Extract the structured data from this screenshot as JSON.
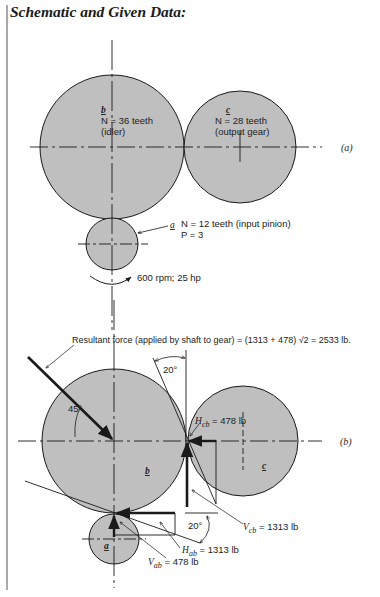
{
  "title": "Schematic and Given Data:",
  "colors": {
    "gear_fill": "#bfbfbf",
    "line": "#1a1a1a",
    "background": "#ffffff"
  },
  "diagram_a": {
    "panel_label": "(a)",
    "gear_b": {
      "letter": "b",
      "teeth": "N = 36 teeth",
      "role": "(idler)"
    },
    "gear_c": {
      "letter": "c",
      "teeth": "N = 28 teeth",
      "role": "(output gear)"
    },
    "gear_a": {
      "letter": "a",
      "teeth": "N = 12 teeth (input pinion)",
      "pitch": "P = 3"
    },
    "input": "600 rpm; 25 hp"
  },
  "diagram_b": {
    "panel_label": "(b)",
    "resultant": "Resultant force (applied by shaft to gear) = (1313 + 478)  √2 = 2533 lb.",
    "angle_45": "45°",
    "angle_20_top": "20°",
    "angle_20_bottom": "20°",
    "gear_b_letter": "b",
    "gear_c_letter": "c",
    "gear_a_letter": "a",
    "H_cb": {
      "sym": "H",
      "sub": "cb",
      "val": " = 478 lb"
    },
    "V_cb": {
      "sym": "V",
      "sub": "cb",
      "val": " = 1313 lb"
    },
    "H_ab": {
      "sym": "H",
      "sub": "ab",
      "val": " = 1313 lb"
    },
    "V_ab": {
      "sym": "V",
      "sub": "ab",
      "val": " = 478 lb"
    }
  }
}
